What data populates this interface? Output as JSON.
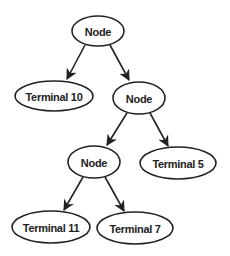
{
  "diagram": {
    "type": "tree",
    "nodes": [
      {
        "id": "root",
        "label": "Node",
        "cx": 98,
        "cy": 31,
        "rx": 26,
        "ry": 15
      },
      {
        "id": "t10",
        "label": "Terminal 10",
        "cx": 54,
        "cy": 96,
        "rx": 39,
        "ry": 15
      },
      {
        "id": "n2",
        "label": "Node",
        "cx": 139,
        "cy": 98,
        "rx": 26,
        "ry": 16
      },
      {
        "id": "n3",
        "label": "Node",
        "cx": 94,
        "cy": 162,
        "rx": 26,
        "ry": 16
      },
      {
        "id": "t5",
        "label": "Terminal 5",
        "cx": 178,
        "cy": 163,
        "rx": 38,
        "ry": 16
      },
      {
        "id": "t11",
        "label": "Terminal 11",
        "cx": 51,
        "cy": 227,
        "rx": 39,
        "ry": 16
      },
      {
        "id": "t7",
        "label": "Terminal 7",
        "cx": 135,
        "cy": 228,
        "rx": 38,
        "ry": 16
      }
    ],
    "edges": [
      {
        "from": "root",
        "to": "t10",
        "x1": 85,
        "y1": 45,
        "x2": 67,
        "y2": 79
      },
      {
        "from": "root",
        "to": "n2",
        "x1": 110,
        "y1": 45,
        "x2": 129,
        "y2": 80
      },
      {
        "from": "n2",
        "to": "n3",
        "x1": 127,
        "y1": 113,
        "x2": 107,
        "y2": 145
      },
      {
        "from": "n2",
        "to": "t5",
        "x1": 150,
        "y1": 113,
        "x2": 168,
        "y2": 146
      },
      {
        "from": "n3",
        "to": "t11",
        "x1": 83,
        "y1": 177,
        "x2": 64,
        "y2": 210
      },
      {
        "from": "n3",
        "to": "t7",
        "x1": 105,
        "y1": 177,
        "x2": 124,
        "y2": 211
      }
    ]
  }
}
